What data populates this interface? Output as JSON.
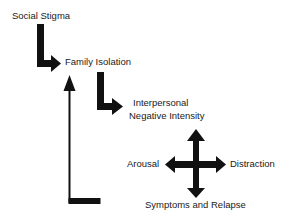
{
  "diagram": {
    "nodes": [
      {
        "id": "social_stigma",
        "label": "Social Stigma"
      },
      {
        "id": "family_isolation",
        "label": "Family Isolation"
      },
      {
        "id": "interpersonal_negative_intensity",
        "label_line1": "Interpersonal",
        "label_line2": "Negative Intensity"
      },
      {
        "id": "arousal",
        "label": "Arousal"
      },
      {
        "id": "distraction",
        "label": "Distraction"
      },
      {
        "id": "symptoms_relapse",
        "label": "Symptoms and Relapse"
      }
    ],
    "edges": [
      {
        "from": "social_stigma",
        "to": "family_isolation",
        "style": "thick-elbow-arrow"
      },
      {
        "from": "family_isolation",
        "to": "interpersonal_negative_intensity",
        "style": "thick-elbow-arrow"
      },
      {
        "from": "symptoms_relapse",
        "to": "family_isolation",
        "style": "thin-feedback-arrow"
      },
      {
        "center": "cross",
        "to": [
          "arousal",
          "distraction",
          "symptoms_relapse",
          "interpersonal_negative_intensity"
        ],
        "style": "four-way-arrow"
      }
    ],
    "colors": {
      "arrow": "#111111",
      "text": "#1a1a1a",
      "background": "#ffffff"
    }
  }
}
